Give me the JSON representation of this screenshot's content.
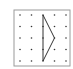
{
  "diagram": {
    "type": "geoboard",
    "grid": {
      "rows": 5,
      "cols": 5
    },
    "frame_color": "#9a9a9a",
    "dot_color": "#333333",
    "line_color": "#333333",
    "shape": {
      "name": "triangle",
      "vertices_grid": [
        [
          2,
          0
        ],
        [
          3,
          2
        ],
        [
          2,
          4
        ]
      ]
    }
  }
}
